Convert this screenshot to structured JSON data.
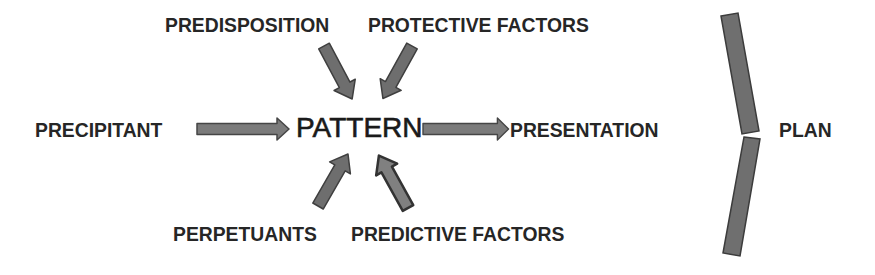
{
  "diagram": {
    "center": {
      "label": "PATTERN"
    },
    "top_inputs": [
      {
        "label": "PREDISPOSITION"
      },
      {
        "label": "PROTECTIVE FACTORS"
      }
    ],
    "bottom_inputs": [
      {
        "label": "PERPETUANTS"
      },
      {
        "label": "PREDICTIVE FACTORS"
      }
    ],
    "left_input": {
      "label": "PRECIPITANT"
    },
    "output": {
      "label": "PRESENTATION"
    },
    "result": {
      "label": "PLAN"
    },
    "colors": {
      "arrow_fill": "#7b7b7b",
      "arrow_stroke": "#454545",
      "text": "#262626"
    }
  }
}
